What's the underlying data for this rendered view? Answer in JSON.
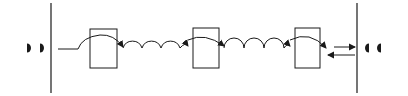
{
  "diagram": {
    "type": "schematic",
    "background": "#ffffff",
    "stroke_color": "#1a1a1a",
    "left_end": {
      "glyph": "half-disc-right-facing",
      "count": 2,
      "positions_x": [
        28,
        41
      ],
      "center_y": 48
    },
    "right_end": {
      "glyph": "half-disc-left-facing",
      "count": 2,
      "positions_x": [
        367,
        380
      ],
      "center_y": 48
    },
    "barriers": [
      {
        "id": "left-barrier",
        "x": 51,
        "y1": 3,
        "y2": 93
      },
      {
        "id": "right-barrier",
        "x": 357,
        "y1": 3,
        "y2": 93
      }
    ],
    "boxes": [
      {
        "id": "box-1",
        "x": 90,
        "y": 29,
        "width": 27,
        "height": 39
      },
      {
        "id": "box-2",
        "x": 193,
        "y": 28,
        "width": 26,
        "height": 40
      },
      {
        "id": "box-3",
        "x": 295,
        "y": 28,
        "width": 25,
        "height": 40
      }
    ],
    "connectors": [
      {
        "id": "input-line",
        "from": "left-barrier",
        "to": "box-1",
        "style": "straight-then-arc"
      },
      {
        "id": "hop-chain-1",
        "from": "box-1",
        "to": "box-2",
        "style": "scalloped-arcs",
        "arc_count": 3
      },
      {
        "id": "hop-chain-2",
        "from": "box-2",
        "to": "box-3",
        "style": "scalloped-arcs",
        "arc_count": 3
      },
      {
        "id": "output-arrow",
        "from": "box-3",
        "to": "right-barrier",
        "direction": "right"
      },
      {
        "id": "return-arrow",
        "from": "right-barrier",
        "to": "box-3",
        "direction": "left"
      }
    ]
  }
}
